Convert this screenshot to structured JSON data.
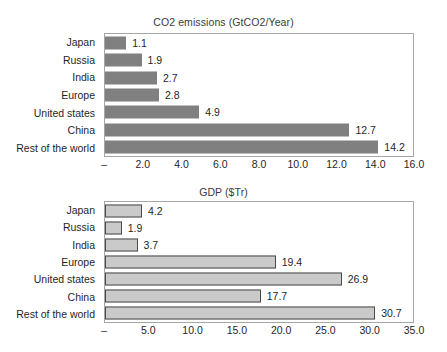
{
  "chart_data": [
    {
      "id": "co2",
      "type": "bar",
      "orientation": "horizontal",
      "title": "CO2 emissions (GtCO2/Year)",
      "xlabel": "",
      "ylabel": "",
      "categories": [
        "Japan",
        "Russia",
        "India",
        "Europe",
        "United states",
        "China",
        "Rest of the world"
      ],
      "values": [
        1.1,
        1.9,
        2.7,
        2.8,
        4.9,
        12.7,
        14.2
      ],
      "value_labels": [
        "1.1",
        "1.9",
        "2.7",
        "2.8",
        "4.9",
        "12.7",
        "14.2"
      ],
      "xlim": [
        0,
        16
      ],
      "xticks": [
        0,
        2,
        4,
        6,
        8,
        10,
        12,
        14,
        16
      ],
      "xtick_labels": [
        "–",
        "2.0",
        "4.0",
        "6.0",
        "8.0",
        "10.0",
        "12.0",
        "14.0",
        "16.0"
      ],
      "grid": false,
      "legend": false,
      "bar_color": "#808080",
      "bar_border_color": "none"
    },
    {
      "id": "gdp",
      "type": "bar",
      "orientation": "horizontal",
      "title": "GDP ($Tr)",
      "xlabel": "",
      "ylabel": "",
      "categories": [
        "Japan",
        "Russia",
        "India",
        "Europe",
        "United states",
        "China",
        "Rest of the world"
      ],
      "values": [
        4.2,
        1.9,
        3.7,
        19.4,
        26.9,
        17.7,
        30.7
      ],
      "value_labels": [
        "4.2",
        "1.9",
        "3.7",
        "19.4",
        "26.9",
        "17.7",
        "30.7"
      ],
      "xlim": [
        0,
        35
      ],
      "xticks": [
        0,
        5,
        10,
        15,
        20,
        25,
        30,
        35
      ],
      "xtick_labels": [
        "–",
        "5.0",
        "10.0",
        "15.0",
        "20.0",
        "25.0",
        "30.0",
        "35.0"
      ],
      "grid": false,
      "legend": false,
      "bar_color": "#cacaca",
      "bar_border_color": "#4a4a4a"
    }
  ],
  "page": {
    "background": "#ffffff",
    "frame_color": "#a6a6a6",
    "text_color": "#1f1f1f"
  }
}
